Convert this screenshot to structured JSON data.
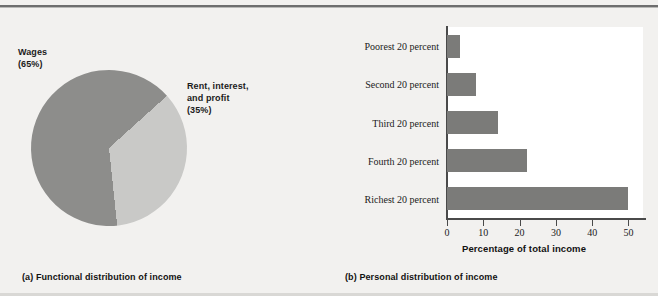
{
  "figure": {
    "background_color": "#f2f1ef",
    "bar_color": "#7b7b79",
    "pie_major_color": "#8d8d8b",
    "pie_minor_color": "#c9c9c7"
  },
  "panel_a": {
    "caption": "(a) Functional distribution of income",
    "label_wages": "Wages",
    "label_wages_pct": "(65%)",
    "label_rent_line1": "Rent, interest,",
    "label_rent_line2": "and profit",
    "label_rent_pct": "(35%)"
  },
  "panel_b": {
    "caption": "(b) Personal distribution of income",
    "x_title": "Percentage of total income"
  },
  "chart_data": [
    {
      "type": "pie",
      "title": "(a) Functional distribution of income",
      "labels": [
        "Wages",
        "Rent, interest, and profit"
      ],
      "values": [
        65,
        35
      ],
      "value_labels": [
        "(65%)",
        "(35%)"
      ],
      "colors": [
        "#8d8d8b",
        "#c9c9c7"
      ],
      "units": "percent",
      "legend": "inline-labels"
    },
    {
      "type": "bar",
      "orientation": "horizontal",
      "title": "(b) Personal distribution of income",
      "categories": [
        "Poorest 20 percent",
        "Second 20 percent",
        "Third 20 percent",
        "Fourth 20 percent",
        "Richest 20 percent"
      ],
      "values": [
        3.5,
        8,
        14,
        22,
        50
      ],
      "xlabel": "Percentage of total income",
      "ylabel": "",
      "xlim": [
        0,
        54
      ],
      "xticks": [
        0,
        10,
        20,
        30,
        40,
        50
      ],
      "xtick_labels": [
        "0",
        "10",
        "20",
        "30",
        "40",
        "50"
      ],
      "grid": false,
      "legend": "none",
      "bar_color": "#7b7b79"
    }
  ]
}
